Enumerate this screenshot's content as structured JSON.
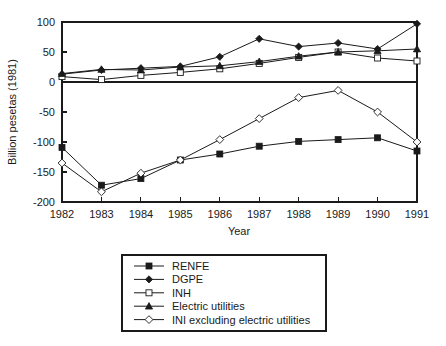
{
  "chart_data": {
    "type": "line",
    "title": "",
    "xlabel": "Year",
    "ylabel": "Billion pesetas (1981)",
    "x": [
      1982,
      1983,
      1984,
      1985,
      1986,
      1987,
      1988,
      1989,
      1990,
      1991
    ],
    "xticklabels": [
      "1982",
      "1983",
      "1984",
      "1985",
      "1986",
      "1987",
      "1988",
      "1989",
      "1990",
      "1991"
    ],
    "yticklabels": [
      "100",
      "50",
      "0",
      "-50",
      "-100",
      "-150",
      "-200"
    ],
    "yticks": [
      100,
      50,
      0,
      -50,
      -100,
      -150,
      -200
    ],
    "xlim": [
      1982,
      1991
    ],
    "ylim": [
      -200,
      100
    ],
    "grid": false,
    "legend_position": "below-plot",
    "series": [
      {
        "name": "RENFE",
        "marker": "filled-square",
        "values": [
          -109,
          -172,
          -161,
          -130,
          -120,
          -107,
          -99,
          -96,
          -93,
          -115
        ]
      },
      {
        "name": "DGPE",
        "marker": "filled-diamond",
        "values": [
          13,
          20,
          23,
          26,
          42,
          72,
          59,
          65,
          55,
          97
        ]
      },
      {
        "name": "INH",
        "marker": "open-square",
        "values": [
          9,
          4,
          11,
          16,
          22,
          31,
          41,
          50,
          40,
          35
        ]
      },
      {
        "name": "Electric utilities",
        "marker": "filled-triangle",
        "values": [
          14,
          21,
          20,
          25,
          27,
          34,
          43,
          50,
          52,
          55
        ]
      },
      {
        "name": "INI excluding electric utilities",
        "marker": "open-diamond",
        "values": [
          -135,
          -183,
          -152,
          -130,
          -96,
          -61,
          -26,
          -14,
          -50,
          -100
        ]
      }
    ]
  },
  "legend": {
    "items": [
      {
        "label": "RENFE"
      },
      {
        "label": "DGPE"
      },
      {
        "label": "INH"
      },
      {
        "label": "Electric utilities"
      },
      {
        "label": "INI excluding electric utilities"
      }
    ]
  },
  "axes": {
    "x_title": "Year",
    "y_title": "Billion pesetas (1981)"
  }
}
